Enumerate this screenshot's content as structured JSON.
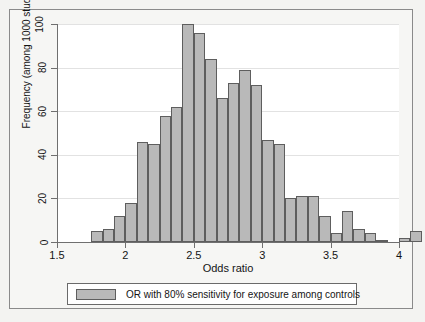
{
  "figure": {
    "background_color": "#f3f3f1",
    "plot_background_color": "#ffffff",
    "frame_border_color": "#8a8a8a"
  },
  "legend": {
    "label": "OR with 80% sensitivity for exposure among controls",
    "swatch_color": "#b9b9b9",
    "swatch_border_color": "#5e5e5e",
    "position": "below-axes"
  },
  "chart_data": {
    "type": "bar",
    "title": "",
    "subtitle": "",
    "xlabel": "Odds ratio",
    "ylabel": "Frequency (among 1000 studies)",
    "xlim": [
      1.5,
      4.0
    ],
    "ylim": [
      0,
      100
    ],
    "grid": true,
    "grid_axis": "y",
    "legend_position": "below",
    "bar_color": "#b9b9b9",
    "bar_border_color": "#5e5e5e",
    "bin_width": 0.0833,
    "xticks": [
      1.5,
      2.0,
      2.5,
      3.0,
      3.5,
      4.0
    ],
    "xtick_labels": [
      "1.5",
      "2",
      "2.5",
      "3",
      "3.5",
      "4"
    ],
    "yticks": [
      0,
      20,
      40,
      60,
      80,
      100
    ],
    "ytick_labels": [
      "0",
      "20",
      "40",
      "60",
      "80",
      "100"
    ],
    "series": [
      {
        "name": "OR with 80% sensitivity for exposure among controls",
        "bin_starts": [
          1.75,
          1.833,
          1.917,
          2.0,
          2.083,
          2.167,
          2.25,
          2.333,
          2.417,
          2.5,
          2.583,
          2.667,
          2.75,
          2.833,
          2.917,
          3.0,
          3.083,
          3.167,
          3.25,
          3.333,
          3.417,
          3.5,
          3.583,
          3.667,
          3.75,
          3.833,
          3.917
        ],
        "bin_centers": [
          1.792,
          1.875,
          1.958,
          2.042,
          2.125,
          2.208,
          2.292,
          2.375,
          2.458,
          2.542,
          2.625,
          2.708,
          2.792,
          2.875,
          2.958,
          3.042,
          3.125,
          3.208,
          3.292,
          3.375,
          3.458,
          3.542,
          3.625,
          3.708,
          3.792,
          3.875,
          3.958
        ],
        "values": [
          5,
          6,
          12,
          18,
          46,
          45,
          58,
          62,
          100,
          96,
          84,
          66,
          73,
          79,
          72,
          47,
          45,
          20,
          21,
          21,
          12,
          4,
          14,
          6,
          4,
          1,
          0,
          2,
          5
        ]
      }
    ],
    "peak": {
      "bin_center": 2.458,
      "value": 100
    },
    "annotations": []
  }
}
